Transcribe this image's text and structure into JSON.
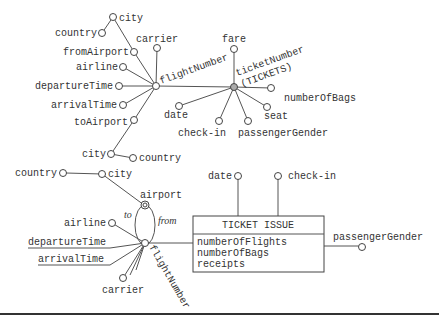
{
  "top_diagram": {
    "center_node": "flightNumber",
    "ticket_node": {
      "line1": "ticketNumber",
      "line2": "(TICKETS)"
    },
    "flight_attrs": {
      "city_from": "city",
      "country_from": "country",
      "fromAirport": "fromAirport",
      "carrier": "carrier",
      "airline": "airline",
      "departureTime": "departureTime",
      "arrivalTime": "arrivalTime",
      "toAirport": "toAirport",
      "city_to": "city",
      "country_to": "country"
    },
    "ticket_attrs": {
      "fare": "fare",
      "numberOfBags": "numberOfBags",
      "seat": "seat",
      "date": "date",
      "checkin": "check-in",
      "passengerGender": "passengerGender"
    }
  },
  "bottom_diagram": {
    "country": "country",
    "city": "city",
    "airport": "airport",
    "to": "to",
    "from": "from",
    "airline": "airline",
    "departureTime": "departureTime",
    "arrivalTime": "arrivalTime",
    "carrier": "carrier",
    "flightNumber": "flightNumber",
    "date": "date",
    "checkin": "check-in",
    "passengerGender": "passengerGender",
    "fact_box": {
      "title": "TICKET ISSUE",
      "measures": [
        "numberOfFlights",
        "numberOfBags",
        "receipts"
      ]
    }
  }
}
